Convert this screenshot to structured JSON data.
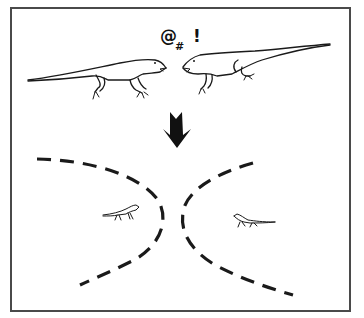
{
  "figure": {
    "exclamation": {
      "at_symbol": "@",
      "hash_symbol": "#",
      "bang_symbol": "!"
    },
    "top_panel": {
      "left_lizard": "lizard-facing-right",
      "right_lizard": "lizard-facing-left"
    },
    "transition": {
      "icon": "down-arrow-icon"
    },
    "bottom_panel": {
      "left_territory": {
        "boundary": "dashed-arc-left",
        "occupant": "small-lizard-facing-right"
      },
      "right_territory": {
        "boundary": "dashed-arc-right",
        "occupant": "small-lizard-facing-left"
      }
    },
    "colors": {
      "background": "#ffffff",
      "frame": "#4a4a4a",
      "ink": "#1a1a1a"
    }
  }
}
